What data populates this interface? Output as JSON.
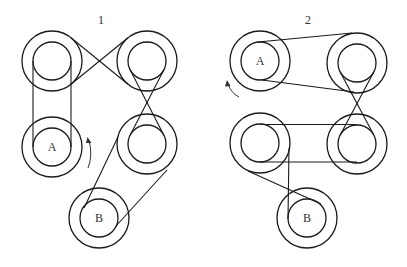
{
  "colors": {
    "stroke": "#1a1a1a",
    "background": "#ffffff"
  },
  "diagrams": [
    {
      "number": "1",
      "number_pos": [
        101,
        20
      ],
      "pulleys": [
        {
          "id": "TL",
          "label": "",
          "cx": 52,
          "cy": 61,
          "r_outer": 30,
          "r_inner": 19
        },
        {
          "id": "TR",
          "label": "",
          "cx": 147,
          "cy": 61,
          "r_outer": 30,
          "r_inner": 19
        },
        {
          "id": "A",
          "label": "A",
          "cx": 52,
          "cy": 147,
          "r_outer": 30,
          "r_inner": 19
        },
        {
          "id": "BR",
          "label": "",
          "cx": 147,
          "cy": 144,
          "r_outer": 30,
          "r_inner": 19
        },
        {
          "id": "B",
          "label": "B",
          "cx": 99,
          "cy": 218,
          "r_outer": 30,
          "r_inner": 19
        }
      ],
      "belts": [
        {
          "from": "TL",
          "to": "A",
          "type": "open",
          "lines": [
            [
              33,
              61,
              33,
              147
            ],
            [
              71,
              61,
              71,
              147
            ]
          ]
        },
        {
          "from": "TL",
          "to": "TR",
          "type": "crossed",
          "lines": [
            [
              71,
              37.8,
              128,
              84.2
            ],
            [
              71,
              84.2,
              128,
              37.8
            ]
          ]
        },
        {
          "from": "TR",
          "to": "BR",
          "type": "crossed",
          "lines": [
            [
              130.1,
              69.7,
              163.9,
              135.3
            ],
            [
              163.9,
              69.7,
              130.1,
              135.3
            ]
          ]
        },
        {
          "from": "BR",
          "to": "B",
          "type": "open",
          "lines": [
            [
              118,
              137,
              84,
              208
            ],
            [
              167,
              170,
              116,
              226
            ]
          ]
        }
      ],
      "rotation_arrow": {
        "pulley": "A",
        "direction": "counterclockwise",
        "x": 89,
        "y": 146
      }
    },
    {
      "number": "2",
      "number_pos": [
        308,
        20
      ],
      "pulleys": [
        {
          "id": "A",
          "label": "A",
          "cx": 260,
          "cy": 61,
          "r_outer": 30,
          "r_inner": 19
        },
        {
          "id": "TR",
          "label": "",
          "cx": 357,
          "cy": 63,
          "r_outer": 30,
          "r_inner": 19
        },
        {
          "id": "BL",
          "label": "",
          "cx": 260,
          "cy": 143,
          "r_outer": 30,
          "r_inner": 19
        },
        {
          "id": "BR",
          "label": "",
          "cx": 357,
          "cy": 144,
          "r_outer": 30,
          "r_inner": 19
        },
        {
          "id": "B",
          "label": "B",
          "cx": 307,
          "cy": 218,
          "r_outer": 30,
          "r_inner": 19
        }
      ],
      "belts": [
        {
          "from": "A",
          "to": "TR",
          "type": "open",
          "lines": [
            [
              258,
              42,
              352,
              33
            ],
            [
              262,
              80,
              354,
              92
            ]
          ]
        },
        {
          "from": "TR",
          "to": "BR",
          "type": "crossed",
          "lines": [
            [
              340.2,
              71.9,
              373.8,
              135.1
            ],
            [
              373.8,
              71.9,
              340.2,
              135.1
            ]
          ]
        },
        {
          "from": "BL",
          "to": "BR",
          "type": "open",
          "lines": [
            [
              260,
              124.5,
              357,
              124.5
            ],
            [
              260,
              162,
              357,
              162
            ]
          ]
        },
        {
          "from": "BL",
          "to": "B",
          "type": "open",
          "lines": [
            [
              289,
              148,
              288,
              219
            ],
            [
              248,
              171,
              321,
              204
            ]
          ]
        }
      ],
      "rotation_arrow": {
        "pulley": "A",
        "direction": "counterclockwise",
        "x": 232,
        "y": 92
      }
    }
  ]
}
